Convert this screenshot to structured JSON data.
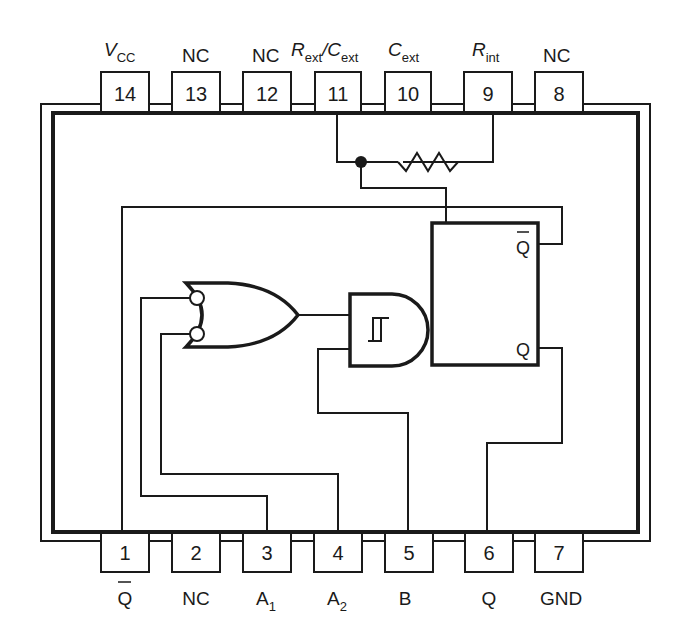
{
  "diagram": {
    "type": "IC pinout / logic diagram"
  },
  "top_pins": [
    {
      "number": "14",
      "name": "V",
      "sub": "CC",
      "italic": true
    },
    {
      "number": "13",
      "name": "NC",
      "sub": "",
      "italic": false
    },
    {
      "number": "12",
      "name": "NC",
      "sub": "",
      "italic": false
    },
    {
      "number": "11",
      "name": "R",
      "sub": "ext",
      "name2": "/C",
      "sub2": "ext",
      "italic": true
    },
    {
      "number": "10",
      "name": "C",
      "sub": "ext",
      "italic": true
    },
    {
      "number": "9",
      "name": "R",
      "sub": "int",
      "italic": true
    },
    {
      "number": "8",
      "name": "NC",
      "sub": "",
      "italic": false
    }
  ],
  "bottom_pins": [
    {
      "number": "1",
      "name": "Q",
      "overbar": true
    },
    {
      "number": "2",
      "name": "NC"
    },
    {
      "number": "3",
      "name": "A",
      "sub": "1"
    },
    {
      "number": "4",
      "name": "A",
      "sub": "2"
    },
    {
      "number": "5",
      "name": "B"
    },
    {
      "number": "6",
      "name": "Q"
    },
    {
      "number": "7",
      "name": "GND"
    }
  ],
  "flipflop": {
    "qbar_label": "Q",
    "q_label": "Q"
  },
  "gates": {
    "or_gate": "OR gate with inverted (bubble) inputs A1, A2",
    "and_gate": "Schmitt-trigger AND gate, inputs from OR output and B"
  },
  "components": {
    "resistor": "Internal resistor between Rext/Cext (pin 11) node and Rint (pin 9)"
  }
}
